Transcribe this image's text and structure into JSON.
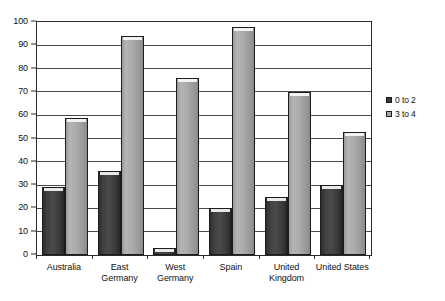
{
  "chart_data": {
    "type": "bar",
    "title": "",
    "subtitle": "",
    "xlabel": "",
    "ylabel": "",
    "ylim": [
      0,
      100
    ],
    "ytick_step": 10,
    "yticks": [
      0,
      10,
      20,
      30,
      40,
      50,
      60,
      70,
      80,
      90,
      100
    ],
    "grid": true,
    "legend_position": "right",
    "categories": [
      "Australia",
      "East Germany",
      "West Germany",
      "Spain",
      "United Kingdom",
      "United States"
    ],
    "series": [
      {
        "name": "0 to 2",
        "color": "#3a3a3a",
        "values": [
          29,
          36,
          3,
          20,
          25,
          30
        ]
      },
      {
        "name": "3 to 4",
        "color": "#a8a8a8",
        "values": [
          59,
          94,
          76,
          98,
          70,
          53
        ]
      }
    ]
  },
  "legend": {
    "items": [
      {
        "label": "0 to 2"
      },
      {
        "label": "3 to 4"
      }
    ]
  },
  "colors": {
    "series_0": "#3a3a3a",
    "series_1": "#a8a8a8",
    "axis": "#2a2a2a",
    "gridline": "#4a4a4a",
    "background": "#ffffff",
    "text": "#111111"
  }
}
